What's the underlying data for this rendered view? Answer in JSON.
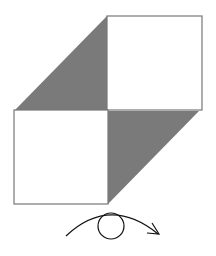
{
  "diagram": {
    "colors": {
      "background": "#ffffff",
      "shade": "#7a7a7a",
      "stroke": "#777777",
      "arrow": "#111111"
    },
    "shapes": {
      "top_right_square": {
        "x": 107,
        "y": 16,
        "w": 95,
        "h": 94
      },
      "bottom_left_square": {
        "x": 14,
        "y": 110,
        "w": 94,
        "h": 94
      },
      "upper_triangle": "15,110 107,16 107,110",
      "lower_triangle": "108,111 199,111 108,204",
      "eye_circle": {
        "cx": 111,
        "cy": 226,
        "r": 13
      },
      "rotation_arc": "M66,236 Q110,195 158,234"
    }
  }
}
